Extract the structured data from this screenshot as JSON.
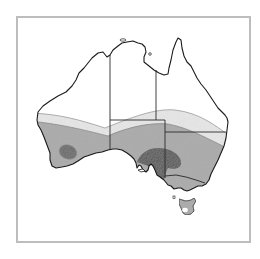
{
  "figure": {
    "type": "map",
    "style": "grayscale shaded zones",
    "frame_color": "#bdbdbd",
    "zones": [
      {
        "name": "unshaded-north",
        "color": "#ffffff"
      },
      {
        "name": "light-band",
        "color": "#ececec"
      },
      {
        "name": "medium-band",
        "color": "#a9a9a9"
      },
      {
        "name": "dark-core-southwest",
        "color": "#5e5e5e"
      },
      {
        "name": "dark-core-southeast",
        "color": "#4d4d4d"
      }
    ],
    "coastline_color": "#1a1a1a",
    "state_border_color": "#2a2a2a"
  }
}
